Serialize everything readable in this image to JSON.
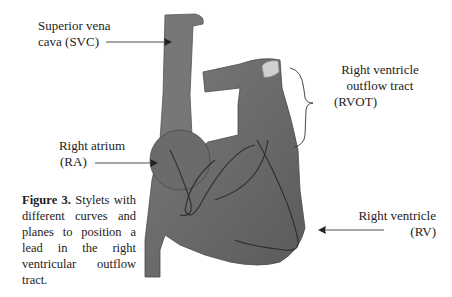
{
  "figure": {
    "caption_label": "Figure 3.",
    "caption_text": " Stylets with different curves and planes to position a lead in the right ventricular outflow tract."
  },
  "labels": {
    "svc": {
      "line1": "Superior vena",
      "line2": "cava (SVC)"
    },
    "rvot": {
      "line1": "Right ventricle",
      "line2": "outflow tract",
      "line3": "(RVOT)"
    },
    "ra": {
      "line1": "Right atrium",
      "line2": "(RA)"
    },
    "rv": {
      "line1": "Right ventricle",
      "line2": "(RV)"
    }
  },
  "colors": {
    "heart_fill": "#6e6e6e",
    "heart_dark": "#4f4f4f",
    "valve": "#c8c8c8",
    "arrow": "#222222"
  }
}
